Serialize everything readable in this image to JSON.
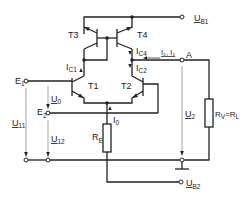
{
  "diagram": {
    "type": "circuit-schematic",
    "transistors": [
      {
        "id": "T1",
        "label": "T1"
      },
      {
        "id": "T2",
        "label": "T2"
      },
      {
        "id": "T3",
        "label": "T3"
      },
      {
        "id": "T4",
        "label": "T4"
      }
    ],
    "terminals": {
      "ub1": {
        "main": "U",
        "sub": "B1"
      },
      "ub2": {
        "main": "U",
        "sub": "B2"
      },
      "e1": {
        "main": "E",
        "sub": "1"
      },
      "e2": {
        "main": "E",
        "sub": "2"
      },
      "a": {
        "main": "A"
      }
    },
    "currents": {
      "ic1": {
        "main": "I",
        "sub": "C1"
      },
      "ic2": {
        "main": "I",
        "sub": "C2"
      },
      "ic4": {
        "main": "I",
        "sub": "C4"
      },
      "i0": {
        "main": "I",
        "sub": "0"
      },
      "i2": {
        "text": "I₂, I₂"
      }
    },
    "voltages": {
      "u0": {
        "main": "U",
        "sub": "0"
      },
      "u11": {
        "main": "U",
        "sub": "11"
      },
      "u12": {
        "main": "U",
        "sub": "12"
      },
      "u2": {
        "main": "U",
        "sub": "2"
      }
    },
    "resistors": {
      "re": {
        "main": "R",
        "sub": "E"
      },
      "rv": {
        "main": "R",
        "sub": "V",
        "eq": "=",
        "main2": "R",
        "sub2": "L"
      }
    }
  }
}
